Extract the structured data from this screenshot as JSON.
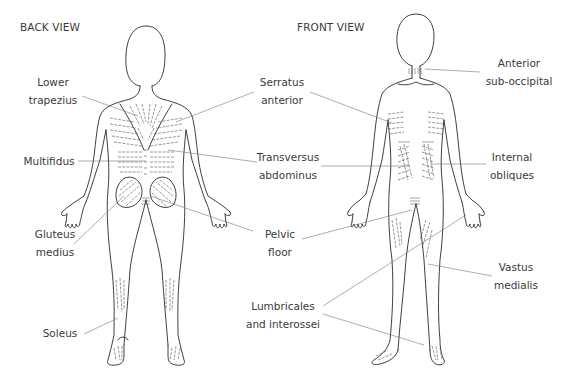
{
  "views": {
    "back": {
      "title": "BACK VIEW"
    },
    "front": {
      "title": "FRONT VIEW"
    }
  },
  "labels": {
    "lower_trapezius": {
      "line1": "Lower",
      "line2": "trapezius"
    },
    "multifidus": {
      "line1": "Multifidus"
    },
    "gluteus_medius": {
      "line1": "Gluteus",
      "line2": "medius"
    },
    "soleus": {
      "line1": "Soleus"
    },
    "serratus_anterior": {
      "line1": "Serratus",
      "line2": "anterior"
    },
    "transversus_abdominus": {
      "line1": "Transversus",
      "line2": "abdominus"
    },
    "pelvic_floor": {
      "line1": "Pelvic",
      "line2": "floor"
    },
    "lumbricales_interossei": {
      "line1": "Lumbricales",
      "line2": "and interossei"
    },
    "anterior_suboccipital": {
      "line1": "Anterior",
      "line2": "sub-occipital"
    },
    "internal_obliques": {
      "line1": "Internal",
      "line2": "obliques"
    },
    "vastus_medialis": {
      "line1": "Vastus",
      "line2": "medialis"
    }
  },
  "colors": {
    "outline": "#2a2a2a",
    "text": "#3a3a3a",
    "leader": "#777777",
    "background": "#ffffff"
  }
}
